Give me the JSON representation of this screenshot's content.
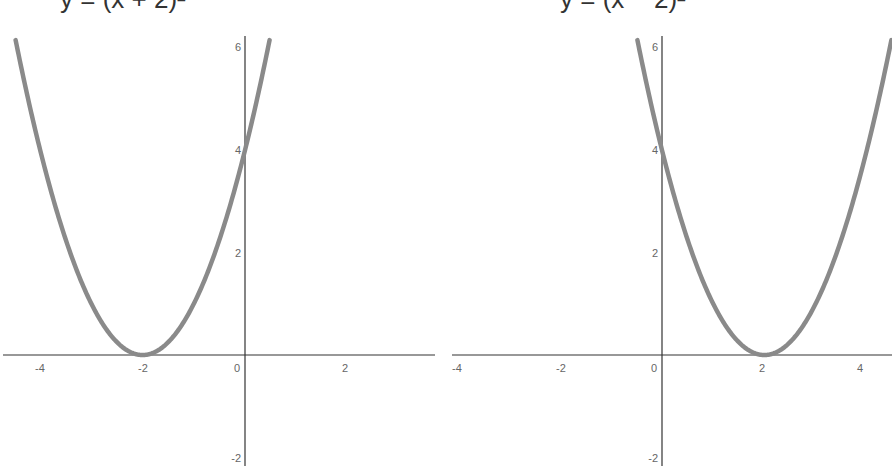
{
  "chart_data": [
    {
      "type": "line",
      "title": "y = (x + 2)²",
      "title_visible_fragment": "y = (x + 2)²",
      "function": "y = (x + 2)^2",
      "xlabel": "",
      "ylabel": "",
      "xlim": [
        -4.7,
        3.7
      ],
      "ylim": [
        -2.3,
        6.3
      ],
      "x_ticks": [
        -4,
        -2,
        0,
        2
      ],
      "y_ticks": [
        -2,
        2,
        4,
        6
      ],
      "origin_label": "0",
      "grid": false,
      "series": [
        {
          "name": "y = (x + 2)^2",
          "x": [
            -4.5,
            -4,
            -3.5,
            -3,
            -2.5,
            -2,
            -1.5,
            -1,
            -0.5,
            0,
            0.5
          ],
          "y": [
            6.25,
            4,
            2.25,
            1,
            0.25,
            0,
            0.25,
            1,
            2.25,
            4,
            6.25
          ]
        }
      ],
      "vertex": [
        -2,
        0
      ],
      "y_intercept": 4
    },
    {
      "type": "line",
      "title": "y = (x − 2)²",
      "title_visible_fragment": "y = (x − 2)²",
      "function": "y = (x - 2)^2",
      "xlabel": "",
      "ylabel": "",
      "xlim": [
        -4.1,
        4.5
      ],
      "ylim": [
        -2.3,
        6.3
      ],
      "x_ticks": [
        -4,
        -2,
        0,
        2,
        4
      ],
      "y_ticks": [
        -2,
        2,
        4,
        6
      ],
      "origin_label": "0",
      "grid": false,
      "series": [
        {
          "name": "y = (x - 2)^2",
          "x": [
            -0.5,
            0,
            0.5,
            1,
            1.5,
            2,
            2.5,
            3,
            3.5,
            4,
            4.5
          ],
          "y": [
            6.25,
            4,
            2.25,
            1,
            0.25,
            0,
            0.25,
            1,
            2.25,
            4,
            6.25
          ]
        }
      ],
      "vertex": [
        2,
        0
      ],
      "y_intercept": 4
    }
  ],
  "titles": {
    "left": "y = (x + 2)²",
    "right": "y = (x − 2)²"
  },
  "ticks": {
    "left": {
      "x": [
        "-4",
        "-2",
        "0",
        "2"
      ],
      "y": [
        "6",
        "4",
        "2",
        "-2"
      ]
    },
    "right": {
      "x": [
        "-4",
        "-2",
        "0",
        "2",
        "4"
      ],
      "y": [
        "6",
        "4",
        "2",
        "-2"
      ]
    }
  },
  "colors": {
    "axis": "#333333",
    "curve": "#8a8a8a",
    "tick_text": "#666666"
  }
}
